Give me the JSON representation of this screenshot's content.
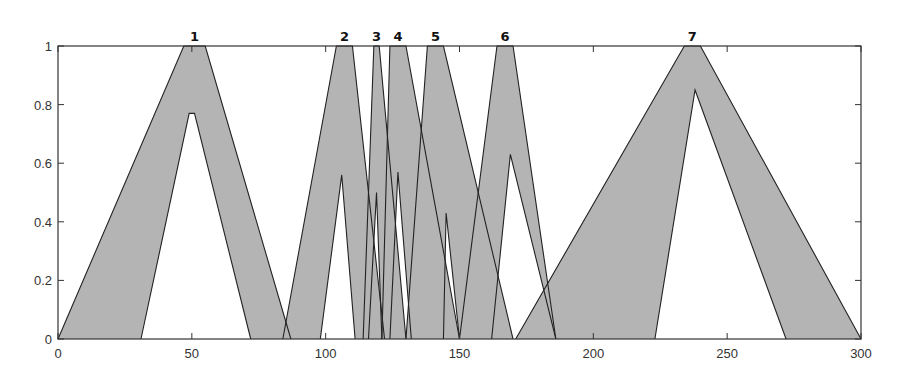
{
  "chart_data": {
    "type": "area",
    "title": "",
    "xlabel": "",
    "ylabel": "",
    "xlim": [
      0,
      300
    ],
    "ylim": [
      0,
      1
    ],
    "grid": false,
    "legend": "none",
    "x_ticks": [
      0,
      50,
      100,
      150,
      200,
      250,
      300
    ],
    "y_ticks": [
      0,
      0.2,
      0.4,
      0.6,
      0.8,
      1
    ],
    "y_tick_labels": [
      "0",
      "0.2",
      "0.4",
      "0.6",
      "0.8",
      "1"
    ],
    "fill_color": "#b4b4b4",
    "line_color": "#222222",
    "series": [
      {
        "name": "1",
        "upper": [
          [
            0,
            0
          ],
          [
            47,
            1
          ],
          [
            55,
            1
          ],
          [
            87,
            0
          ]
        ],
        "lower": [
          [
            31,
            0
          ],
          [
            49,
            0.77
          ],
          [
            51,
            0.77
          ],
          [
            72,
            0
          ]
        ]
      },
      {
        "name": "2",
        "upper": [
          [
            84,
            0
          ],
          [
            104,
            1
          ],
          [
            110,
            1
          ],
          [
            122,
            0
          ]
        ],
        "lower": [
          [
            98,
            0
          ],
          [
            106,
            0.56
          ],
          [
            111,
            0
          ]
        ]
      },
      {
        "name": "3",
        "upper": [
          [
            114,
            0
          ],
          [
            118,
            1
          ],
          [
            120,
            1
          ],
          [
            130,
            0
          ]
        ],
        "lower": [
          [
            116,
            0
          ],
          [
            119,
            0.5
          ],
          [
            121,
            0
          ]
        ]
      },
      {
        "name": "4",
        "upper": [
          [
            121,
            0
          ],
          [
            124,
            1
          ],
          [
            130,
            1
          ],
          [
            150,
            0
          ]
        ],
        "lower": [
          [
            124,
            0
          ],
          [
            127,
            0.57
          ],
          [
            132,
            0
          ]
        ]
      },
      {
        "name": "5",
        "upper": [
          [
            130,
            0
          ],
          [
            138,
            1
          ],
          [
            144,
            1
          ],
          [
            170,
            0
          ]
        ],
        "lower": [
          [
            144,
            0
          ],
          [
            145,
            0.43
          ],
          [
            150,
            0
          ]
        ]
      },
      {
        "name": "6",
        "upper": [
          [
            150,
            0
          ],
          [
            164,
            1
          ],
          [
            170,
            1
          ],
          [
            186,
            0
          ]
        ],
        "lower": [
          [
            162,
            0
          ],
          [
            169,
            0.63
          ],
          [
            186,
            0
          ]
        ]
      },
      {
        "name": "7",
        "upper": [
          [
            171,
            0
          ],
          [
            234,
            1
          ],
          [
            240,
            1
          ],
          [
            300,
            0
          ]
        ],
        "lower": [
          [
            223,
            0
          ],
          [
            238,
            0.85
          ],
          [
            272,
            0
          ]
        ]
      }
    ]
  },
  "layout": {
    "plot_left": 58,
    "plot_right": 861,
    "plot_top": 46,
    "plot_bottom": 339
  }
}
